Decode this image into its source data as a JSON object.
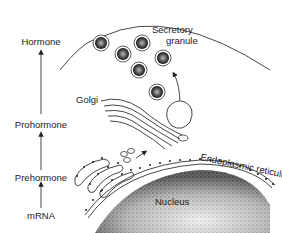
{
  "pathway": {
    "steps": [
      "mRNA",
      "Prehormone",
      "Prohormone",
      "Hormone"
    ]
  },
  "labels": {
    "secretory_line1": "Secretory",
    "secretory_line2": "granule",
    "golgi": "Golgi",
    "er": "Endoplasmic reticulum",
    "nucleus": "Nucleus"
  },
  "colors": {
    "ink": "#222222",
    "background": "#ffffff"
  }
}
